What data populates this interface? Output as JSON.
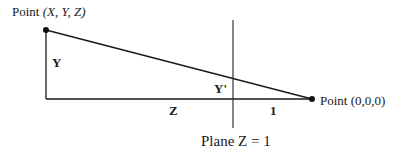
{
  "diagram": {
    "labels": {
      "point_xyz_prefix": "Point ",
      "point_xyz_coords": "(X, Y, Z)",
      "y": "Y",
      "y_prime": "Y'",
      "z": "Z",
      "one": "1",
      "origin": "Point (0,0,0)",
      "plane": "Plane Z = 1"
    },
    "colors": {
      "line": "#1a1a1a",
      "plane_line": "#333333"
    }
  }
}
